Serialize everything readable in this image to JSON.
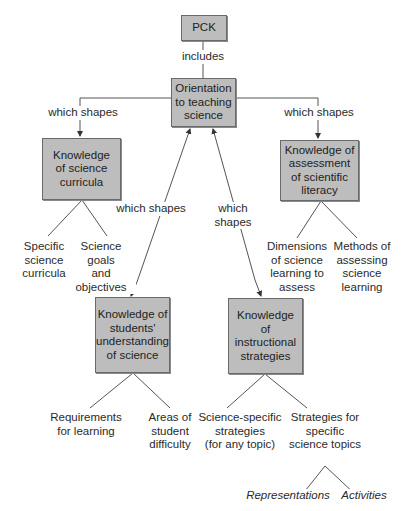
{
  "diagram": {
    "root": {
      "label": "PCK"
    },
    "root_link": "includes",
    "center": {
      "label": "Orientation\nto teaching\nscience"
    },
    "links": {
      "left": "which shapes",
      "right": "which shapes",
      "mid_left": "which shapes",
      "mid_right": "which shapes"
    },
    "nodes": {
      "curricula": {
        "label": "Knowledge\nof science\ncurricula",
        "children": [
          "Specific\nscience\ncurricula",
          "Science goals\nand\nobjectives"
        ]
      },
      "assessment": {
        "label": "Knowledge of\nassessment\nof scientific\nliteracy",
        "children": [
          "Dimensions\nof science\nlearning to\nassess",
          "Methods of\nassessing\nscience\nlearning"
        ]
      },
      "students": {
        "label": "Knowledge of\nstudents'\nunderstanding\nof science",
        "children": [
          "Requirements\nfor learning",
          "Areas of\nstudent\ndifficulty"
        ]
      },
      "instructional": {
        "label": "Knowledge\nof\ninstructional\nstrategies",
        "children": [
          "Science-specific\nstrategies\n(for any topic)",
          "Strategies for\nspecific\nscience topics"
        ],
        "grandchildren": [
          "Representations",
          "Activities"
        ]
      }
    },
    "colors": {
      "box_fill": "#bdbdbd",
      "box_border": "#6a6a6a",
      "line": "#555555"
    }
  }
}
